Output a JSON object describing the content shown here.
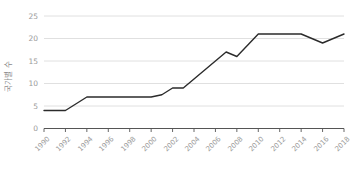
{
  "chart_data": {
    "type": "line",
    "title": "",
    "xlabel": "",
    "ylabel": "국가별 수",
    "ylim": [
      0,
      25
    ],
    "xlim": [
      1990,
      2018
    ],
    "yticks": [
      0,
      5,
      10,
      15,
      20,
      25
    ],
    "ytick_labels": [
      "0",
      "5",
      "10",
      "15",
      "20",
      "25"
    ],
    "categories": [
      1990,
      1992,
      1994,
      1996,
      1998,
      2000,
      2002,
      2004,
      2006,
      2008,
      2010,
      2012,
      2014,
      2016,
      2018
    ],
    "xtick_labels": [
      "1990",
      "1992",
      "1994",
      "1996",
      "1998",
      "2000",
      "2002",
      "2004",
      "2006",
      "2008",
      "2010",
      "2012",
      "2014",
      "2016",
      "2018"
    ],
    "grid": true,
    "grid_axis": "y",
    "legend": false,
    "series": [
      {
        "name": "국가별 수",
        "color": "#2b2b2b",
        "x": [
          1990,
          1991,
          1992,
          1993,
          1994,
          1995,
          1996,
          1997,
          1998,
          1999,
          2000,
          2001,
          2002,
          2003,
          2004,
          2005,
          2006,
          2007,
          2008,
          2009,
          2010,
          2011,
          2012,
          2013,
          2014,
          2015,
          2016,
          2017,
          2018
        ],
        "values": [
          4,
          4,
          4,
          5.5,
          7,
          7,
          7,
          7,
          7,
          7,
          7,
          7.5,
          9,
          9,
          11,
          13,
          15,
          17,
          16,
          18.5,
          21,
          21,
          21,
          21,
          21,
          20,
          19,
          20,
          21
        ]
      }
    ]
  },
  "colors": {
    "line": "#2b2b2b",
    "grid": "#dcdcdc",
    "axis": "#555555",
    "tick_text": "#9a9a9a",
    "background": "#ffffff"
  }
}
